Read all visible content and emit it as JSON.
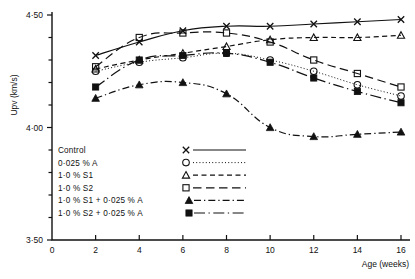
{
  "chart_data": {
    "type": "line",
    "title": "",
    "subtitle": "",
    "xlabel": "Age  (weeks)",
    "ylabel": "Upv  (km/s)",
    "xlim": [
      0,
      16
    ],
    "ylim": [
      3.5,
      4.5
    ],
    "grid": false,
    "legend_position": "inside-bottom-left",
    "x_ticks": [
      0,
      2,
      4,
      6,
      8,
      10,
      12,
      14,
      16
    ],
    "x_tick_labels": [
      "0",
      "2",
      "4",
      "6",
      "8",
      "10",
      "12",
      "14",
      "16"
    ],
    "y_ticks": [
      3.5,
      4.0,
      4.5
    ],
    "y_tick_labels": [
      "3·50",
      "4·00",
      "4·50"
    ],
    "y_minor_ticks": [
      3.6,
      3.7,
      3.8,
      3.9,
      4.1,
      4.2,
      4.3,
      4.4
    ],
    "x": [
      2,
      4,
      6,
      8,
      10,
      12,
      14,
      16
    ],
    "series": [
      {
        "name": "Control",
        "marker": "cross",
        "linestyle": "solid",
        "values": [
          4.32,
          4.38,
          4.43,
          4.45,
          4.45,
          4.46,
          4.47,
          4.48
        ]
      },
      {
        "name": "0·025 %  A",
        "marker": "open-circle",
        "linestyle": "dotted",
        "values": [
          4.25,
          4.29,
          4.31,
          4.33,
          4.3,
          4.25,
          4.19,
          4.14
        ]
      },
      {
        "name": "1·0 %  S1",
        "marker": "open-triangle",
        "linestyle": "dashed",
        "values": [
          4.26,
          4.3,
          4.33,
          4.36,
          4.39,
          4.4,
          4.4,
          4.41
        ]
      },
      {
        "name": "1·0 %  S2",
        "marker": "open-square",
        "linestyle": "long-dash",
        "values": [
          4.27,
          4.4,
          4.42,
          4.42,
          4.38,
          4.3,
          4.24,
          4.18
        ]
      },
      {
        "name": "1·0 %  S1 + 0·025 %  A",
        "marker": "filled-triangle",
        "linestyle": "dash-dot",
        "values": [
          4.13,
          4.19,
          4.2,
          4.15,
          4.0,
          3.96,
          3.97,
          3.98
        ]
      },
      {
        "name": "1·0 %  S2 + 0·025 %  A",
        "marker": "filled-square",
        "linestyle": "dash-dot-long",
        "values": [
          4.18,
          4.3,
          4.32,
          4.33,
          4.29,
          4.22,
          4.16,
          4.11
        ]
      }
    ],
    "annotations": []
  },
  "legend": {
    "entries": [
      "Control",
      "0·025 %  A",
      "1·0 %  S1",
      "1·0 %  S2",
      "1·0 %  S1 + 0·025 %  A",
      "1·0 %  S2 + 0·025 %  A"
    ]
  }
}
